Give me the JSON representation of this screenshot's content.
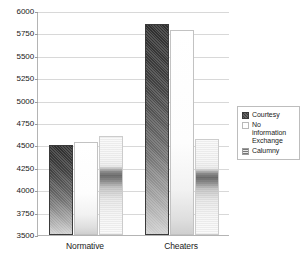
{
  "chart_data": {
    "type": "bar",
    "title": "",
    "subtitle": "",
    "xlabel": "",
    "ylabel": "",
    "categories": [
      "Normative",
      "Cheaters"
    ],
    "series": [
      {
        "name": "Courtesy",
        "values": [
          4510,
          5860
        ]
      },
      {
        "name": "No information\nExchange",
        "values": [
          4540,
          5790
        ]
      },
      {
        "name": "Calumny",
        "values": [
          4610,
          4570
        ]
      }
    ],
    "ylim": [
      3500,
      6000
    ],
    "ytick_values": [
      3500,
      3750,
      4000,
      4250,
      4500,
      4750,
      5000,
      5250,
      5500,
      5750,
      6000
    ],
    "ytick_labels": [
      "3500",
      "3750",
      "4000",
      "4250",
      "4500",
      "4750",
      "5000",
      "5250",
      "5500",
      "5750",
      "6000"
    ],
    "grid": true,
    "grid_axis": "y",
    "legend_position": "right",
    "legend_entries": [
      {
        "label": "Courtesy",
        "swatch": "dark-hatched"
      },
      {
        "label": "No information\nExchange",
        "swatch": "white"
      },
      {
        "label": "Calumny",
        "swatch": "gray-banded"
      }
    ],
    "colors": {
      "courtesy": "#3d3d3d",
      "no_information_exchange": "#ffffff",
      "calumny": "#8a8a8a",
      "gridline": "#d8d8d8",
      "axis": "#b4b4b4",
      "text": "#1a1a1a",
      "background": "#ffffff"
    }
  }
}
